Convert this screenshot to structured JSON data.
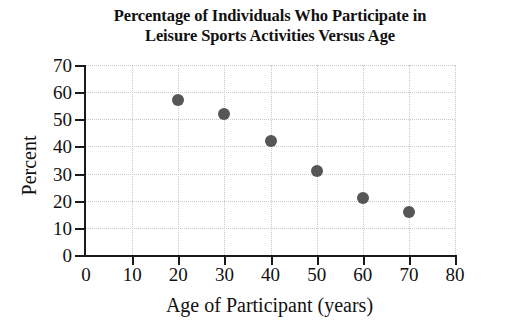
{
  "chart_data": {
    "type": "scatter",
    "title": "Percentage of Individuals Who Participate in Leisure Sports Activities Versus Age",
    "title_lines": [
      "Percentage of Individuals Who Participate in",
      "Leisure Sports Activities Versus Age"
    ],
    "xlabel": "Age of Participant (years)",
    "ylabel": "Percent",
    "xlim": [
      0,
      80
    ],
    "ylim": [
      0,
      70
    ],
    "xticks": [
      0,
      10,
      20,
      30,
      40,
      50,
      60,
      70,
      80
    ],
    "yticks": [
      0,
      10,
      20,
      30,
      40,
      50,
      60,
      70
    ],
    "xtick_labels": [
      "0",
      "10",
      "20",
      "30",
      "40",
      "50",
      "60",
      "70",
      "80"
    ],
    "ytick_labels": [
      "0",
      "10",
      "20",
      "30",
      "40",
      "50",
      "60",
      "70"
    ],
    "grid": true,
    "legend": null,
    "marker_color": "#565656",
    "axis_color": "#1a1a1a",
    "grid_color": "#c9c9c9",
    "x": [
      20,
      30,
      40,
      50,
      60,
      70
    ],
    "y": [
      57,
      52,
      42,
      31,
      21,
      16
    ],
    "points": [
      {
        "x": 20,
        "y": 57
      },
      {
        "x": 30,
        "y": 52
      },
      {
        "x": 40,
        "y": 42
      },
      {
        "x": 50,
        "y": 31
      },
      {
        "x": 60,
        "y": 21
      },
      {
        "x": 70,
        "y": 16
      }
    ]
  }
}
